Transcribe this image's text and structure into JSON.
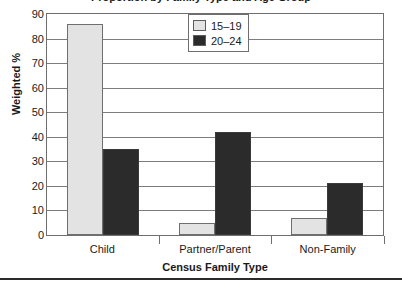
{
  "figure": {
    "title_clipped": "Proportion by Family Type and Age Group"
  },
  "chart_data": {
    "type": "bar",
    "title": "",
    "xlabel": "Census Family Type",
    "ylabel": "Weighted %",
    "categories": [
      "Child",
      "Partner/Parent",
      "Non-Family"
    ],
    "series": [
      {
        "name": "15–19",
        "color": "#e3e3e3",
        "values": [
          86,
          5,
          7
        ]
      },
      {
        "name": "20–24",
        "color": "#2b2b2b",
        "values": [
          35,
          42,
          21
        ]
      }
    ],
    "ylim": [
      0,
      90
    ],
    "ytick_labels": [
      "90",
      "80",
      "70",
      "60",
      "50",
      "40",
      "30",
      "20",
      "10",
      "0"
    ],
    "ytick_values": [
      90,
      80,
      70,
      60,
      50,
      40,
      30,
      20,
      10,
      0
    ],
    "grid": true,
    "legend_position": "top-center"
  },
  "legend": {
    "items": [
      {
        "label": "15–19",
        "color": "#e3e3e3"
      },
      {
        "label": "20–24",
        "color": "#2b2b2b"
      }
    ]
  },
  "axes": {
    "y_title": "Weighted %",
    "x_title": "Census Family Type"
  }
}
